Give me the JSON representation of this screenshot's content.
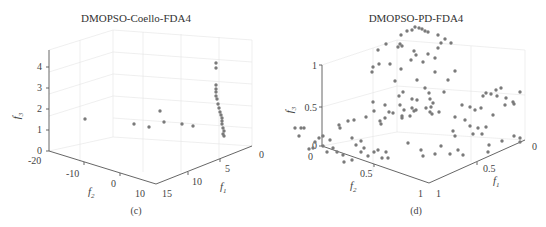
{
  "chart_data": [
    {
      "type": "scatter",
      "subtype": "scatter3d",
      "panel": "(c)",
      "title": "DMOPSO-Coello-FDA4",
      "xlabel": "f1",
      "ylabel": "f2",
      "zlabel": "f3",
      "xticks": [
        "0",
        "5",
        "10",
        "15"
      ],
      "yticks": [
        "-20",
        "-10",
        "0",
        "10"
      ],
      "zticks": [
        "0",
        "1",
        "2",
        "3",
        "4"
      ],
      "xlim": [
        0,
        15
      ],
      "ylim": [
        -20,
        10
      ],
      "zlim": [
        0,
        4
      ],
      "grid": true,
      "points_screen": [
        [
          85,
          119
        ],
        [
          134,
          124
        ],
        [
          149,
          127
        ],
        [
          160,
          111
        ],
        [
          164,
          122
        ],
        [
          182,
          124
        ],
        [
          193,
          126
        ],
        [
          216,
          63
        ],
        [
          216,
          68
        ],
        [
          216,
          85
        ],
        [
          216,
          89
        ],
        [
          216,
          92
        ],
        [
          216,
          96
        ],
        [
          217,
          99
        ],
        [
          218,
          104
        ],
        [
          219,
          108
        ],
        [
          220,
          112
        ],
        [
          221,
          115
        ],
        [
          222,
          118
        ],
        [
          222,
          121
        ],
        [
          222,
          124
        ],
        [
          223,
          128
        ],
        [
          224,
          131
        ],
        [
          223,
          134
        ],
        [
          224,
          136
        ]
      ]
    },
    {
      "type": "scatter",
      "subtype": "scatter3d",
      "panel": "(d)",
      "title": "DMOPSO-PD-FDA4",
      "xlabel": "f1",
      "ylabel": "f2",
      "zlabel": "f3",
      "xticks": [
        "0",
        "0.5",
        "1"
      ],
      "yticks": [
        "0",
        "0.5",
        "1"
      ],
      "zticks": [
        "0",
        "0.5",
        "1"
      ],
      "xlim": [
        0,
        1
      ],
      "ylim": [
        0,
        1
      ],
      "zlim": [
        0,
        1
      ],
      "grid": true,
      "points_screen": [
        [
          415,
          27
        ],
        [
          419,
          28
        ],
        [
          422,
          29
        ],
        [
          425,
          31
        ],
        [
          428,
          32
        ],
        [
          407,
          31
        ],
        [
          412,
          30
        ],
        [
          401,
          35
        ],
        [
          438,
          35
        ],
        [
          445,
          39
        ],
        [
          451,
          43
        ],
        [
          441,
          43
        ],
        [
          438,
          48
        ],
        [
          400,
          44
        ],
        [
          398,
          47
        ],
        [
          402,
          46
        ],
        [
          386,
          44
        ],
        [
          378,
          50
        ],
        [
          414,
          51
        ],
        [
          416,
          55
        ],
        [
          428,
          54
        ],
        [
          435,
          58
        ],
        [
          423,
          62
        ],
        [
          411,
          60
        ],
        [
          390,
          64
        ],
        [
          401,
          69
        ],
        [
          379,
          64
        ],
        [
          373,
          67
        ],
        [
          372,
          72
        ],
        [
          435,
          72
        ],
        [
          455,
          71
        ],
        [
          448,
          80
        ],
        [
          417,
          80
        ],
        [
          395,
          81
        ],
        [
          403,
          92
        ],
        [
          444,
          92
        ],
        [
          373,
          102
        ],
        [
          399,
          96
        ],
        [
          425,
          88
        ],
        [
          429,
          93
        ],
        [
          385,
          105
        ],
        [
          400,
          105
        ],
        [
          412,
          99
        ],
        [
          417,
          100
        ],
        [
          430,
          99
        ],
        [
          433,
          103
        ],
        [
          412,
          108
        ],
        [
          426,
          108
        ],
        [
          416,
          110
        ],
        [
          414,
          111
        ],
        [
          393,
          113
        ],
        [
          410,
          116
        ],
        [
          389,
          112
        ],
        [
          431,
          107
        ],
        [
          430,
          112
        ],
        [
          432,
          114
        ],
        [
          439,
          112
        ],
        [
          385,
          118
        ],
        [
          402,
          116
        ],
        [
          404,
          110
        ],
        [
          374,
          111
        ],
        [
          366,
          117
        ],
        [
          348,
          121
        ],
        [
          354,
          120
        ],
        [
          339,
          125
        ],
        [
          340,
          128
        ],
        [
          380,
          121
        ],
        [
          381,
          124
        ],
        [
          402,
          118
        ],
        [
          455,
          117
        ],
        [
          483,
          96
        ],
        [
          491,
          94
        ],
        [
          496,
          90
        ],
        [
          501,
          88
        ],
        [
          486,
          93
        ],
        [
          497,
          96
        ],
        [
          506,
          98
        ],
        [
          513,
          102
        ],
        [
          505,
          105
        ],
        [
          514,
          104
        ],
        [
          520,
          92
        ],
        [
          475,
          110
        ],
        [
          481,
          108
        ],
        [
          462,
          105
        ],
        [
          470,
          107
        ],
        [
          493,
          115
        ],
        [
          465,
          120
        ],
        [
          470,
          126
        ],
        [
          478,
          128
        ],
        [
          486,
          127
        ],
        [
          453,
          131
        ],
        [
          473,
          134
        ],
        [
          482,
          134
        ],
        [
          455,
          136
        ],
        [
          520,
          138
        ],
        [
          520,
          142
        ],
        [
          323,
          136
        ],
        [
          319,
          138
        ],
        [
          315,
          142
        ],
        [
          323,
          146
        ],
        [
          327,
          152
        ],
        [
          333,
          148
        ],
        [
          337,
          152
        ],
        [
          343,
          155
        ],
        [
          352,
          138
        ],
        [
          356,
          145
        ],
        [
          361,
          141
        ],
        [
          364,
          148
        ],
        [
          378,
          150
        ],
        [
          382,
          158
        ],
        [
          386,
          152
        ],
        [
          388,
          158
        ],
        [
          313,
          148
        ],
        [
          309,
          149
        ],
        [
          304,
          128
        ],
        [
          301,
          128
        ],
        [
          295,
          128
        ],
        [
          299,
          136
        ],
        [
          330,
          140
        ],
        [
          344,
          162
        ],
        [
          352,
          160
        ],
        [
          361,
          152
        ],
        [
          368,
          156
        ],
        [
          374,
          152
        ],
        [
          408,
          143
        ],
        [
          423,
          156
        ],
        [
          435,
          154
        ],
        [
          441,
          146
        ],
        [
          421,
          150
        ],
        [
          458,
          150
        ],
        [
          463,
          155
        ],
        [
          450,
          154
        ],
        [
          489,
          145
        ],
        [
          502,
          141
        ],
        [
          514,
          136
        ],
        [
          488,
          152
        ]
      ]
    }
  ],
  "figure": {
    "panels": [
      {
        "id": "c",
        "title": "DMOPSO-Coello-FDA4",
        "caption": "(c)",
        "axis_labels": {
          "x": "f",
          "x_sub": "1",
          "y": "f",
          "y_sub": "2",
          "z": "f",
          "z_sub": "3"
        },
        "zticks": [
          "4",
          "3",
          "2",
          "1",
          "0"
        ],
        "yticks": [
          "-20",
          "-10",
          "0",
          "10"
        ],
        "xticks": [
          "15",
          "10",
          "5",
          "0"
        ]
      },
      {
        "id": "d",
        "title": "DMOPSO-PD-FDA4",
        "caption": "(d)",
        "axis_labels": {
          "x": "f",
          "x_sub": "1",
          "y": "f",
          "y_sub": "2",
          "z": "f",
          "z_sub": "3"
        },
        "zticks": [
          "1",
          "0.5",
          "0"
        ],
        "yticks": [
          "0",
          "0.5",
          "1"
        ],
        "xticks": [
          "1",
          "0.5",
          "0"
        ]
      }
    ],
    "colors": {
      "marker": "#7a7a7a",
      "axis": "#555555",
      "grid": "#e4e4e4",
      "text": "#444444"
    }
  }
}
